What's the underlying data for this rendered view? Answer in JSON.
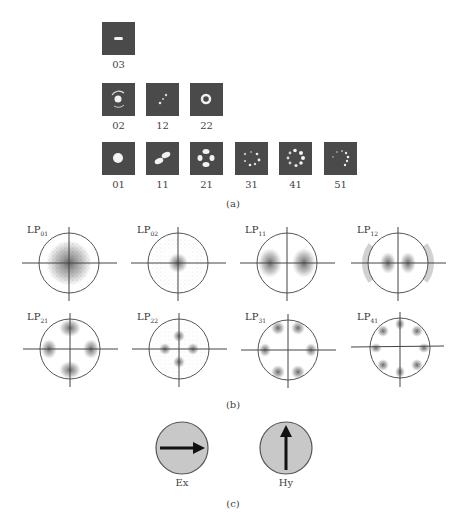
{
  "panel_a": {
    "caption": "(a)",
    "thumbnail_color": "#4a4a4a",
    "rows": [
      {
        "modes": [
          {
            "label": "03"
          }
        ]
      },
      {
        "modes": [
          {
            "label": "02"
          },
          {
            "label": "12"
          },
          {
            "label": "22"
          }
        ]
      },
      {
        "modes": [
          {
            "label": "01"
          },
          {
            "label": "11"
          },
          {
            "label": "21"
          },
          {
            "label": "31"
          },
          {
            "label": "41"
          },
          {
            "label": "51"
          }
        ]
      }
    ]
  },
  "panel_b": {
    "caption": "(b)",
    "plots": [
      {
        "name": "LP",
        "sub": "01"
      },
      {
        "name": "LP",
        "sub": "02"
      },
      {
        "name": "LP",
        "sub": "11"
      },
      {
        "name": "LP",
        "sub": "12"
      },
      {
        "name": "LP",
        "sub": "21"
      },
      {
        "name": "LP",
        "sub": "22"
      },
      {
        "name": "LP",
        "sub": "31"
      },
      {
        "name": "LP",
        "sub": "41"
      }
    ]
  },
  "panel_c": {
    "caption": "(c)",
    "fill_color": "#c8c8c8",
    "fields": [
      {
        "label": "Ex",
        "direction": "right-arrow"
      },
      {
        "label": "Hy",
        "direction": "up-arrow"
      }
    ]
  }
}
